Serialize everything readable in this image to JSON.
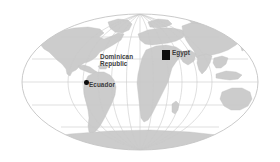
{
  "map": {
    "projection": "mollweide-elliptical",
    "background_color": "#ffffff",
    "land_color": "#cccccc",
    "land_edge_color": "#bfbfbf",
    "graticule_color": "#c9c9c9",
    "outline_color": "#c4c4c4",
    "marker_color": "#0d0d0d",
    "label_color": "#3c3c3c",
    "labels": [
      {
        "name": "dominican-republic",
        "lines": [
          "Dominican",
          "Republic"
        ],
        "x": 100,
        "y": 53,
        "marker": "none"
      },
      {
        "name": "egypt",
        "lines": [
          "Egypt"
        ],
        "x": 172,
        "y": 49,
        "marker": "square"
      },
      {
        "name": "ecuador",
        "lines": [
          "Ecuador"
        ],
        "x": 89,
        "y": 82,
        "marker": "dot"
      }
    ],
    "markers": [
      {
        "name": "egypt-marker",
        "shape": "square",
        "x": 162,
        "y": 50,
        "w": 8,
        "h": 10
      },
      {
        "name": "ecuador-marker",
        "shape": "dot",
        "x": 84,
        "y": 80,
        "w": 4,
        "h": 4
      }
    ]
  }
}
